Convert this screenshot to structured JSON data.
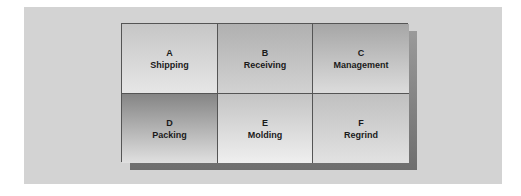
{
  "diagram": {
    "type": "facility-layout-grid",
    "rows": 2,
    "columns": 3,
    "departments": [
      {
        "letter": "A",
        "name": "Shipping"
      },
      {
        "letter": "B",
        "name": "Receiving"
      },
      {
        "letter": "C",
        "name": "Management"
      },
      {
        "letter": "D",
        "name": "Packing"
      },
      {
        "letter": "E",
        "name": "Molding"
      },
      {
        "letter": "F",
        "name": "Regrind"
      }
    ]
  },
  "colors": {
    "panel_background": "#d3d3d3",
    "shadow": "#6e6e6e",
    "border": "#555555",
    "text": "#1a1a1a"
  }
}
